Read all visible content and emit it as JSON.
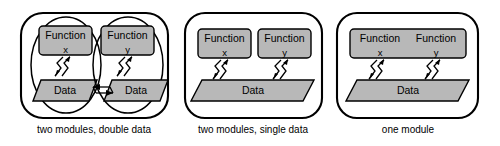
{
  "figure": {
    "type": "diagram",
    "kind": "module-decomposition-comparison",
    "background_color": "#ffffff",
    "outline_color": "#000000",
    "shape_fill_color": "#b8b8b8",
    "panels": [
      {
        "id": "panel-1",
        "caption": "two modules, double data",
        "container_shape": "rounded-rectangle",
        "submodules": [
          {
            "id": "submodule-1a",
            "shape": "ellipse",
            "function_box": {
              "title": "Function",
              "variable": "x"
            },
            "data_shape": {
              "label": "Data",
              "shape": "parallelogram"
            },
            "connector": "double-zigzag-arrow"
          },
          {
            "id": "submodule-1b",
            "shape": "ellipse",
            "function_box": {
              "title": "Function",
              "variable": "y"
            },
            "data_shape": {
              "label": "Data",
              "shape": "parallelogram"
            },
            "connector": "double-zigzag-arrow"
          }
        ],
        "inter_data_link": "double-headed-arrow"
      },
      {
        "id": "panel-2",
        "caption": "two modules, single data",
        "container_shape": "rounded-rectangle",
        "function_boxes": [
          {
            "title": "Function",
            "variable": "x"
          },
          {
            "title": "Function",
            "variable": "y"
          }
        ],
        "data_shape": {
          "label": "Data",
          "shape": "parallelogram"
        },
        "connectors": [
          "double-zigzag-arrow",
          "double-zigzag-arrow"
        ]
      },
      {
        "id": "panel-3",
        "caption": "one module",
        "container_shape": "rounded-rectangle",
        "function_box": {
          "titles": [
            "Function",
            "Function"
          ],
          "variables": [
            "x",
            "y"
          ]
        },
        "data_shape": {
          "label": "Data",
          "shape": "parallelogram"
        },
        "connectors": [
          "double-zigzag-arrow",
          "double-zigzag-arrow"
        ]
      }
    ]
  }
}
